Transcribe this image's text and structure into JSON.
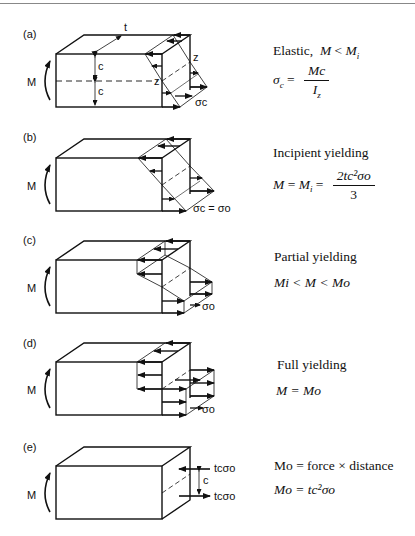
{
  "panels": [
    {
      "id": "a",
      "label": "(a)",
      "moment_label": "M",
      "dim_labels": {
        "thickness": "t",
        "half_depth_top": "c",
        "half_depth_bottom": "c",
        "neutral_axis_1": "z",
        "neutral_axis_2": "z"
      },
      "stress_label": "σc",
      "title": "Elastic,",
      "condition": {
        "lhs": "M",
        "op": "<",
        "rhs": "M",
        "rhs_sub": "i"
      },
      "equation": {
        "lhs": "σ",
        "lhs_sub": "c",
        "eq": "=",
        "num": "Mc",
        "den": "I",
        "den_sub": "z"
      }
    },
    {
      "id": "b",
      "label": "(b)",
      "moment_label": "M",
      "stress_label": "σc = σo",
      "title": "Incipient yielding",
      "equation": {
        "text_lhs": "M = M",
        "lhs_sub": "i",
        "eq": "=",
        "num": "2tc²σo",
        "den": "3"
      }
    },
    {
      "id": "c",
      "label": "(c)",
      "moment_label": "M",
      "stress_label": "σo",
      "title": "Partial yielding",
      "condition": "Mi < M < Mo"
    },
    {
      "id": "d",
      "label": "(d)",
      "moment_label": "M",
      "stress_label": "σo",
      "title": "Full yielding",
      "condition": "M = Mo"
    },
    {
      "id": "e",
      "label": "(e)",
      "moment_label": "M",
      "force_top": "tcσo",
      "force_bottom": "tcσo",
      "arm_label": "c",
      "line1": "Mo = force × distance",
      "line2": "Mo = tc²σo"
    }
  ]
}
